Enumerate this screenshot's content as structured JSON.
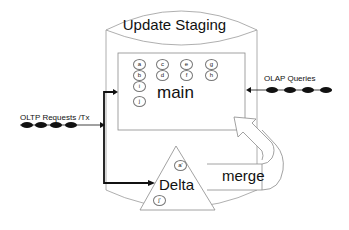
{
  "diagram": {
    "title": "Update Staging",
    "main": {
      "label": "main",
      "nodes": [
        "a",
        "b",
        "c",
        "d",
        "e",
        "f",
        "g",
        "h",
        "i",
        "j"
      ]
    },
    "delta": {
      "label": "Delta",
      "nodes": [
        "a'",
        "j'"
      ]
    },
    "merge": {
      "label": "merge"
    },
    "inputs": {
      "oltp": "OLTP Requests /Tx",
      "olap": "OLAP Queries"
    }
  }
}
